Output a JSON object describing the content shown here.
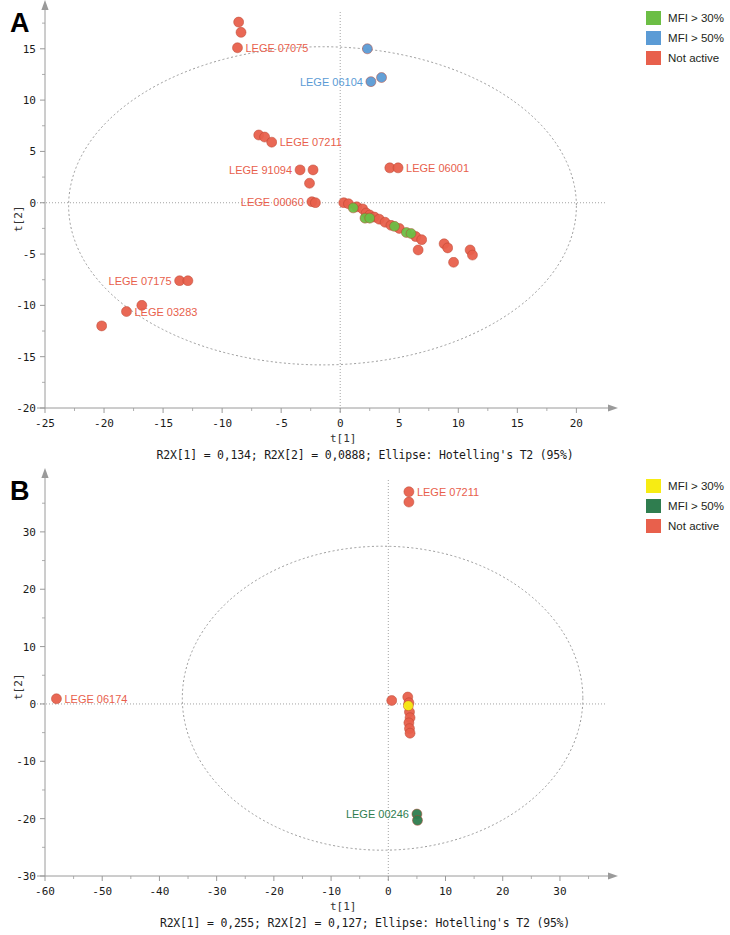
{
  "panels": [
    {
      "letter": "A",
      "legend": [
        {
          "label": "MFI > 30%",
          "color": "#6cbe45"
        },
        {
          "label": "MFI > 50%",
          "color": "#5b9bd5"
        },
        {
          "label": "Not active",
          "color": "#e8604c"
        }
      ],
      "xlabel": "t[1]",
      "ylabel": "t[2]",
      "caption": "R2X[1] = 0,134; R2X[2] = 0,0888; Ellipse: Hotelling's T2 (95%)",
      "chart_data": {
        "type": "scatter",
        "title": "",
        "xlabel": "t[1]",
        "ylabel": "t[2]",
        "xlim": [
          -25,
          22
        ],
        "ylim": [
          -20,
          18
        ],
        "xticks": [
          -25,
          -20,
          -15,
          -10,
          -5,
          0,
          5,
          10,
          15,
          20
        ],
        "yticks": [
          -20,
          -15,
          -10,
          -5,
          0,
          5,
          10,
          15
        ],
        "grid": false,
        "ellipse": {
          "cx": -1.5,
          "cy": -0.3,
          "rx": 21.5,
          "ry": 15.5,
          "label": "Hotelling's T2 (95%)"
        },
        "series": [
          {
            "name": "Not active",
            "color": "#e8604c",
            "points": [
              [
                -8.6,
                17.6
              ],
              [
                -8.4,
                16.6
              ],
              [
                -8.7,
                15.1
              ],
              [
                -6.9,
                6.6
              ],
              [
                -6.4,
                6.4
              ],
              [
                -5.8,
                5.9
              ],
              [
                -3.4,
                3.2
              ],
              [
                -2.3,
                3.2
              ],
              [
                -2.6,
                1.9
              ],
              [
                -2.4,
                0.1
              ],
              [
                -2.1,
                0.0
              ],
              [
                4.2,
                3.4
              ],
              [
                4.9,
                3.4
              ],
              [
                0.3,
                0.0
              ],
              [
                0.7,
                -0.1
              ],
              [
                1.4,
                -0.4
              ],
              [
                1.9,
                -0.6
              ],
              [
                2.2,
                -1.0
              ],
              [
                2.5,
                -1.2
              ],
              [
                2.9,
                -1.4
              ],
              [
                3.3,
                -1.6
              ],
              [
                3.8,
                -1.9
              ],
              [
                4.3,
                -2.2
              ],
              [
                5.0,
                -2.5
              ],
              [
                6.4,
                -3.3
              ],
              [
                6.9,
                -3.6
              ],
              [
                6.6,
                -4.6
              ],
              [
                8.8,
                -4.0
              ],
              [
                9.1,
                -4.4
              ],
              [
                9.6,
                -5.8
              ],
              [
                11.0,
                -4.6
              ],
              [
                11.2,
                -5.1
              ],
              [
                -13.6,
                -7.6
              ],
              [
                -12.9,
                -7.6
              ],
              [
                -16.8,
                -10.0
              ],
              [
                -18.1,
                -10.6
              ],
              [
                -20.2,
                -12.0
              ]
            ]
          },
          {
            "name": "MFI > 30%",
            "color": "#6cbe45",
            "points": [
              [
                1.1,
                -0.5
              ],
              [
                2.1,
                -1.5
              ],
              [
                2.5,
                -1.5
              ],
              [
                4.6,
                -2.3
              ],
              [
                5.6,
                -2.9
              ],
              [
                6.0,
                -3.0
              ]
            ]
          },
          {
            "name": "MFI > 50%",
            "color": "#5b9bd5",
            "points": [
              [
                2.3,
                15.0
              ],
              [
                2.6,
                11.8
              ],
              [
                3.5,
                12.2
              ]
            ]
          }
        ],
        "annotations": [
          {
            "text": "LEGE 07075",
            "x": -8.7,
            "y": 15.1,
            "color": "#e8604c",
            "align": "left"
          },
          {
            "text": "LEGE 06104",
            "x": 2.6,
            "y": 11.8,
            "color": "#5b9bd5",
            "align": "right"
          },
          {
            "text": "LEGE 07211",
            "x": -5.8,
            "y": 5.9,
            "color": "#e8604c",
            "align": "left"
          },
          {
            "text": "LEGE 91094",
            "x": -3.4,
            "y": 3.2,
            "color": "#e8604c",
            "align": "right"
          },
          {
            "text": "LEGE 00060",
            "x": -2.4,
            "y": 0.1,
            "color": "#e8604c",
            "align": "right"
          },
          {
            "text": "LEGE 06001",
            "x": 4.9,
            "y": 3.4,
            "color": "#e8604c",
            "align": "left"
          },
          {
            "text": "LEGE 07175",
            "x": -13.6,
            "y": -7.6,
            "color": "#e8604c",
            "align": "right"
          },
          {
            "text": "LEGE 03283",
            "x": -18.1,
            "y": -10.6,
            "color": "#e8604c",
            "align": "left"
          }
        ]
      }
    },
    {
      "letter": "B",
      "legend": [
        {
          "label": "MFI > 30%",
          "color": "#f7ec13"
        },
        {
          "label": "MFI > 50%",
          "color": "#2f7d4f"
        },
        {
          "label": "Not active",
          "color": "#e8604c"
        }
      ],
      "xlabel": "t[1]",
      "ylabel": "t[2]",
      "caption": "R2X[1] = 0,255; R2X[2] = 0,127; Ellipse: Hotelling's T2 (95%)",
      "chart_data": {
        "type": "scatter",
        "title": "",
        "xlabel": "t[1]",
        "ylabel": "t[2]",
        "xlim": [
          -60,
          37
        ],
        "ylim": [
          -30,
          38
        ],
        "xticks": [
          -60,
          -50,
          -40,
          -30,
          -20,
          -10,
          0,
          10,
          20,
          30
        ],
        "yticks": [
          -30,
          -20,
          -10,
          0,
          10,
          20,
          30
        ],
        "grid": false,
        "ellipse": {
          "cx": -1.0,
          "cy": 1.0,
          "rx": 35.0,
          "ry": 26.5,
          "label": "Hotelling's T2 (95%)"
        },
        "series": [
          {
            "name": "Not active",
            "color": "#e8604c",
            "points": [
              [
                3.6,
                37.0
              ],
              [
                3.6,
                35.2
              ],
              [
                -58.0,
                0.9
              ],
              [
                0.6,
                0.6
              ],
              [
                3.4,
                1.2
              ],
              [
                3.6,
                0.2
              ],
              [
                3.7,
                -1.4
              ],
              [
                3.8,
                -2.4
              ],
              [
                3.6,
                -3.3
              ],
              [
                3.7,
                -4.3
              ],
              [
                3.8,
                -5.1
              ]
            ]
          },
          {
            "name": "MFI > 30%",
            "color": "#f7ec13",
            "points": [
              [
                3.5,
                -0.3
              ]
            ]
          },
          {
            "name": "MFI > 50%",
            "color": "#2f7d4f",
            "points": [
              [
                5.0,
                -19.2
              ],
              [
                5.1,
                -20.3
              ]
            ]
          }
        ],
        "annotations": [
          {
            "text": "LEGE 07211",
            "x": 3.6,
            "y": 37.0,
            "color": "#e8604c",
            "align": "left"
          },
          {
            "text": "LEGE 06174",
            "x": -58.0,
            "y": 0.9,
            "color": "#e8604c",
            "align": "left"
          },
          {
            "text": "LEGE 00246",
            "x": 5.0,
            "y": -19.2,
            "color": "#2f7d4f",
            "align": "right"
          }
        ]
      }
    }
  ]
}
